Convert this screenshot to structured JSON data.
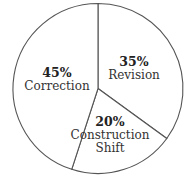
{
  "chart_data": {
    "type": "pie",
    "title": "",
    "categories": [
      "Revision",
      "Construction Shift",
      "Correction"
    ],
    "values": [
      35,
      20,
      45
    ],
    "unit": "%",
    "slices": [
      {
        "label": "Revision",
        "value": 35,
        "pct_text": "35%",
        "label_lines": [
          "Revision"
        ]
      },
      {
        "label": "Construction Shift",
        "value": 20,
        "pct_text": "20%",
        "label_lines": [
          "Construction",
          "Shift"
        ]
      },
      {
        "label": "Correction",
        "value": 45,
        "pct_text": "45%",
        "label_lines": [
          "Correction"
        ]
      }
    ],
    "start_angle": "12 o'clock",
    "direction": "clockwise",
    "fill_color": "#ffffff",
    "stroke_color": "#555555"
  }
}
